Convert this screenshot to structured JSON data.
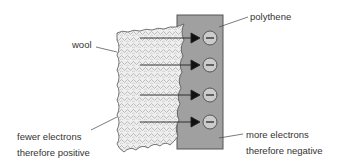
{
  "diagram": {
    "labels": {
      "wool": "wool",
      "polythene": "polythene",
      "wool_state_line1": "fewer electrons",
      "wool_state_line2": "therefore positive",
      "polythene_state_line1": "more electrons",
      "polythene_state_line2": "therefore negative"
    },
    "electrons": [
      {
        "symbol": "−",
        "y": 38
      },
      {
        "symbol": "−",
        "y": 65
      },
      {
        "symbol": "−",
        "y": 95
      },
      {
        "symbol": "−",
        "y": 122
      }
    ],
    "colors": {
      "polythene_fill": "#a0a0a0",
      "electron_fill": "#c8c8c8",
      "wool_fill": "#ececec",
      "stroke": "#444444"
    }
  }
}
